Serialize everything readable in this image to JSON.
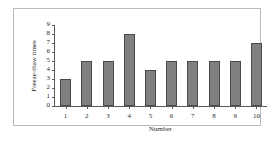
{
  "chart_data": {
    "type": "bar",
    "title": "",
    "xlabel": "Number",
    "ylabel": "Freeze-thaw times",
    "categories": [
      "1",
      "2",
      "3",
      "4",
      "5",
      "6",
      "7",
      "8",
      "9",
      "10"
    ],
    "values": [
      3,
      5,
      5,
      8,
      4,
      5,
      5,
      5,
      5,
      7
    ],
    "ylim": [
      0,
      9
    ],
    "yticks": [
      "0",
      "1",
      "2",
      "3",
      "4",
      "5",
      "6",
      "7",
      "8",
      "9"
    ],
    "grid": false,
    "legend": null,
    "colors": {
      "bar_fill": "#808080",
      "bar_edge": "#4a4a4a",
      "axis": "#5a5a5a",
      "text": "#2b2b2b",
      "frame": "#b9b9b9",
      "background": "#ffffff"
    }
  }
}
